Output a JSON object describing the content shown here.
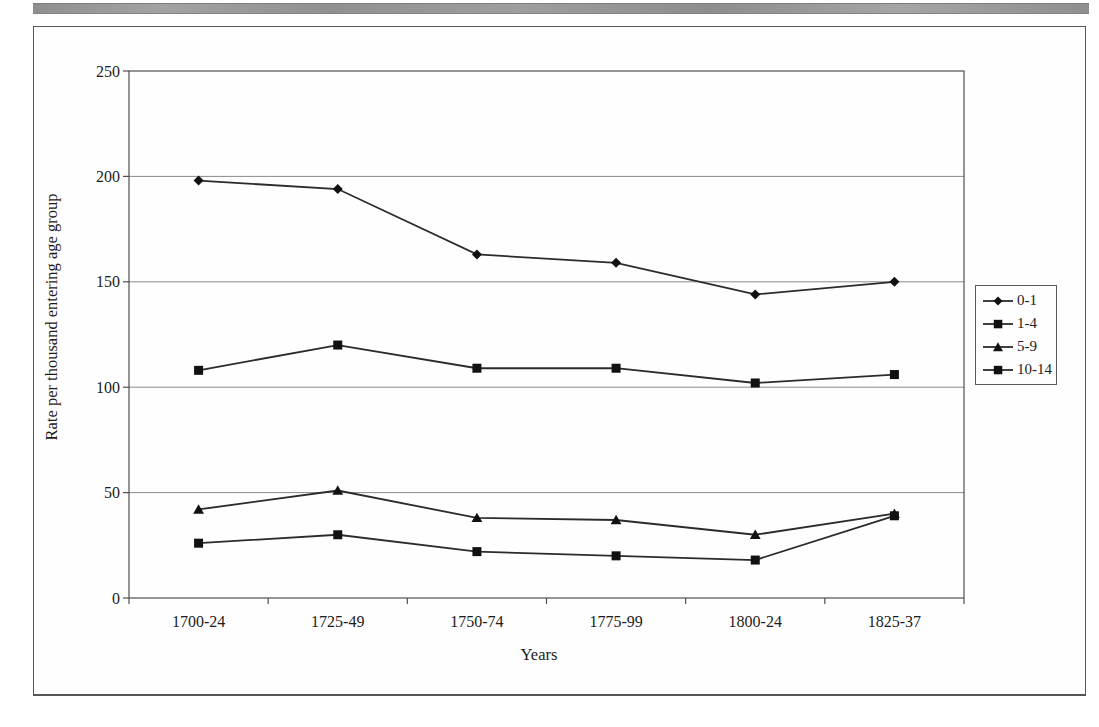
{
  "page": {
    "background": "#ffffff",
    "top_rule_color": "#9a9a9a",
    "figure_border_color": "#565656"
  },
  "chart_data": {
    "type": "line",
    "title": "",
    "xlabel": "Years",
    "ylabel": "Rate per thousand entering age group",
    "ylim": [
      0,
      250
    ],
    "ytick_interval": 50,
    "yticks": [
      0,
      50,
      100,
      150,
      200,
      250
    ],
    "grid": "horizontal",
    "legend_position": "right-outside",
    "categories": [
      "1700-24",
      "1725-49",
      "1750-74",
      "1775-99",
      "1800-24",
      "1825-37"
    ],
    "series": [
      {
        "name": "0-1",
        "marker": "diamond",
        "values": [
          198,
          194,
          163,
          159,
          144,
          150
        ]
      },
      {
        "name": "1-4",
        "marker": "square",
        "values": [
          108,
          120,
          109,
          109,
          102,
          106
        ]
      },
      {
        "name": "5-9",
        "marker": "triangle",
        "values": [
          42,
          51,
          38,
          37,
          30,
          40
        ]
      },
      {
        "name": "10-14",
        "marker": "square",
        "values": [
          26,
          30,
          22,
          20,
          18,
          39
        ]
      }
    ],
    "colors": {
      "line": "#2b2b2b",
      "marker": "#111111",
      "gridline": "#8a8a8a",
      "axis": "#4f4f4f",
      "text": "#1c1c1c"
    }
  }
}
